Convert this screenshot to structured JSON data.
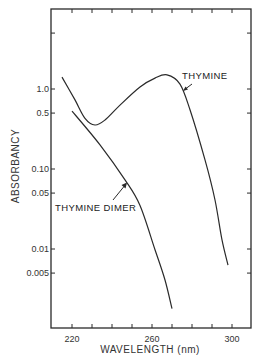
{
  "chart_data": {
    "type": "line",
    "title": "",
    "xlabel": "WAVELENGTH (nm)",
    "ylabel": "ABSORBANCY",
    "xlim": [
      209.5,
      309.5
    ],
    "ylim": [
      0.001,
      10
    ],
    "yscale": "log",
    "grid": false,
    "legend": "none (inline annotations with arrows)",
    "x_ticks": [
      210,
      220,
      230,
      240,
      250,
      260,
      270,
      280,
      290,
      300
    ],
    "x_tick_labels": [
      {
        "value": 220,
        "label": "220"
      },
      {
        "value": 260,
        "label": "260"
      },
      {
        "value": 300,
        "label": "300"
      }
    ],
    "y_ticks": [
      5,
      1.0,
      0.5,
      0.1,
      0.05,
      0.01,
      0.005
    ],
    "y_tick_labels": [
      {
        "value": 1.0,
        "label": "1.0"
      },
      {
        "value": 0.5,
        "label": "0.5"
      },
      {
        "value": 0.1,
        "label": "0.10"
      },
      {
        "value": 0.05,
        "label": "0.05"
      },
      {
        "value": 0.01,
        "label": "0.01"
      },
      {
        "value": 0.005,
        "label": "0.005"
      }
    ],
    "series": [
      {
        "name": "THYMINE",
        "x": [
          215,
          221.5,
          226.5,
          231.5,
          236.5,
          244,
          254,
          261.5,
          267.5,
          274,
          279,
          286.5,
          291.5,
          295,
          298
        ],
        "y": [
          1.41,
          0.73,
          0.43,
          0.355,
          0.41,
          0.63,
          1.06,
          1.37,
          1.5,
          1.15,
          0.55,
          0.13,
          0.041,
          0.013,
          0.0063
        ]
      },
      {
        "name": "THYMINE DIMER",
        "x": [
          220,
          234,
          246.5,
          254,
          261.5,
          266.5,
          270
        ],
        "y": [
          0.53,
          0.2,
          0.073,
          0.035,
          0.0098,
          0.0041,
          0.0018
        ]
      }
    ],
    "annotations": [
      {
        "text": "THYMINE",
        "arrow_to": [
          275.5,
          0.95
        ]
      },
      {
        "text": "THYMINE DIMER",
        "arrow_to": [
          247.5,
          0.073
        ]
      }
    ]
  },
  "labels": {
    "xlabel": "WAVELENGTH (nm)",
    "ylabel": "ABSORBANCY",
    "thymine": "THYMINE",
    "dimer": "THYMINE DIMER",
    "x220": "220",
    "x260": "260",
    "x300": "300",
    "y1": "1.0",
    "y05": "0.5",
    "y010": "0.10",
    "y005": "0.05",
    "y001": "0.01",
    "y0005": "0.005"
  },
  "colors": {
    "line": "#2a2a2a",
    "frame": "#2a2a2a",
    "background": "#ffffff"
  }
}
